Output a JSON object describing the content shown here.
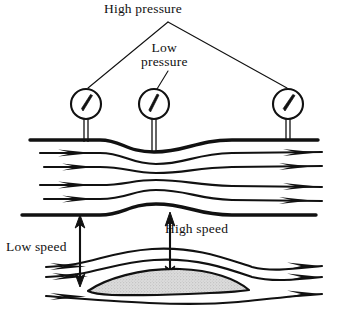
{
  "figure": {
    "title_visible": false,
    "background_color": "#ffffff",
    "ink_color": "#111111",
    "airfoil_fill_color": "#d8d8d8",
    "width": 337,
    "height": 331,
    "labels": {
      "high_pressure": "High pressure",
      "low_pressure_line1": "Low",
      "low_pressure_line2": "pressure",
      "low_speed": "Low speed",
      "high_speed": "High speed"
    },
    "gauges": [
      {
        "name": "left-pressure-gauge",
        "cx": 86,
        "cy": 104,
        "r": 15,
        "needle_angle_deg": -62,
        "reading": "high"
      },
      {
        "name": "center-pressure-gauge",
        "cx": 154,
        "cy": 104,
        "r": 15,
        "needle_angle_deg": -72,
        "reading": "low"
      },
      {
        "name": "right-pressure-gauge",
        "cx": 288,
        "cy": 104,
        "r": 15,
        "needle_angle_deg": -58,
        "reading": "high"
      }
    ],
    "annotations": {
      "low_speed_arrow": {
        "x": 80,
        "y_top": 215,
        "y_bottom": 285,
        "double_headed": true
      },
      "high_speed_arrow": {
        "x": 170,
        "y_top": 213,
        "y_bottom": 278,
        "double_headed": true
      },
      "high_pressure_leader_left_end": [
        86,
        88
      ],
      "high_pressure_leader_right_end": [
        288,
        88
      ],
      "high_pressure_leader_apex": [
        168,
        22
      ],
      "low_pressure_leader_end": [
        157,
        88
      ]
    },
    "venturi": {
      "description": "constricted channel with streamlines",
      "streamline_count": 4,
      "top_wall_y_outer": 138,
      "bottom_wall_y_outer": 213
    },
    "airfoil": {
      "description": "stippled airfoil cross-section with streamlines",
      "streamline_count": 3,
      "chord_left_x": 88,
      "chord_right_x": 245
    }
  }
}
